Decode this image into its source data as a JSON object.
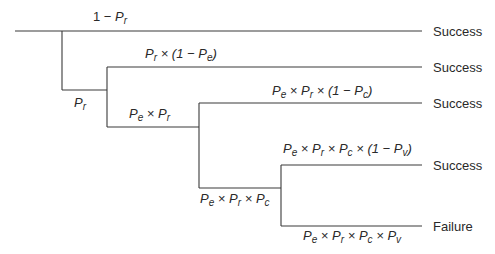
{
  "diagram": {
    "type": "event-tree",
    "outcomes": [
      "Success",
      "Success",
      "Success",
      "Success",
      "Failure"
    ],
    "branch_labels": {
      "b1_top": {
        "pre": "1 − ",
        "P": "P",
        "sub": "r",
        "post": ""
      },
      "b1_bottom": {
        "P": "P",
        "sub": "r"
      },
      "b2_top": "Pr × (1 − Pe)",
      "b2_bottom": "Pe × Pr",
      "b3_top": "Pe × Pr × (1 − Pc)",
      "b3_bottom": "Pe × Pr × Pc",
      "b4_top": "Pe × Pr × Pc × (1 − Pv)",
      "b4_bottom": "Pe × Pr × Pc × Pv"
    },
    "symbols": {
      "P": "P",
      "r": "r",
      "e": "e",
      "c": "c",
      "v": "v",
      "times": " × ",
      "one_minus": "1 − ",
      "lparen": "(",
      "rparen": ")"
    }
  }
}
